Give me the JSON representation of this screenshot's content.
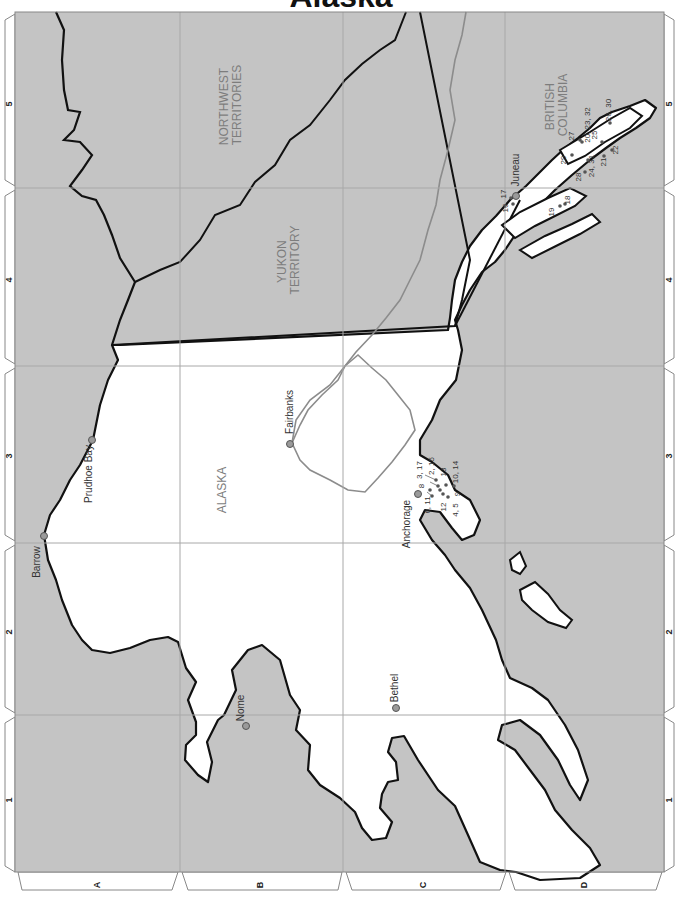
{
  "title": "Alaska",
  "colors": {
    "water": "#c4c4c4",
    "land": "#ffffff",
    "coast": "#111111",
    "border": "#111111",
    "river": "#8c8c8c",
    "grid": "#a8a8a8",
    "region_label": "#7d7d7d",
    "marker": "#9a9a9a"
  },
  "grid": {
    "rows_left": [
      "5",
      "4",
      "3",
      "2",
      "1"
    ],
    "rows_right": [
      "5",
      "4",
      "3",
      "2",
      "1"
    ],
    "columns_bottom": [
      "A",
      "B",
      "C",
      "D"
    ]
  },
  "regions": [
    {
      "id": "alaska",
      "label": "ALASKA"
    },
    {
      "id": "yukon",
      "label_line1": "YUKON",
      "label_line2": "TERRITORY"
    },
    {
      "id": "nwt",
      "label_line1": "NORTHWEST",
      "label_line2": "TERRITORIES"
    },
    {
      "id": "bc",
      "label_line1": "BRITISH",
      "label_line2": "COLUMBIA"
    }
  ],
  "cities": [
    {
      "name": "Barrow"
    },
    {
      "name": "Prudhoe Bay"
    },
    {
      "name": "Fairbanks"
    },
    {
      "name": "Nome"
    },
    {
      "name": "Bethel"
    },
    {
      "name": "Anchorage"
    },
    {
      "name": "Juneau"
    }
  ],
  "anchorage_markers": [
    "3, 17",
    "2, 15",
    "13",
    "10, 14",
    "8",
    "6, 11",
    "12",
    "4, 5",
    "9"
  ],
  "southeast_markers": [
    "17",
    "16",
    "19",
    "18",
    "27",
    "29",
    "20, 23, 32",
    "25",
    "26, 30",
    "28",
    "24, 31",
    "21",
    "22"
  ]
}
